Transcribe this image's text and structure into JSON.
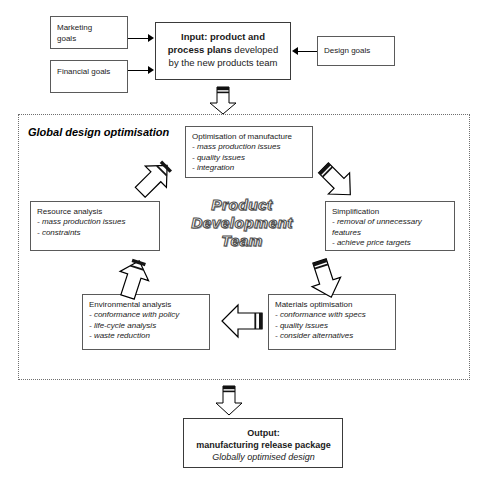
{
  "diagram": {
    "title": "Global design optimisation – product development team cycle",
    "top_cropped_text": "",
    "region_label": "Global design optimisation",
    "centre_wordmark": {
      "line1": "Product",
      "line2": "Development",
      "line3": "Team"
    }
  },
  "inputs": {
    "marketing": {
      "line1": "Marketing",
      "line2": "goals"
    },
    "financial": {
      "line1": "Financial goals",
      "line2": ""
    },
    "design": {
      "line1": "Design goals",
      "line2": ""
    }
  },
  "input_box": {
    "bold1": "Input: product and",
    "bold2": "process plans",
    "plain2": " developed",
    "plain3": "by the new products team"
  },
  "stages": [
    {
      "id": "optimisation-of-manufacture",
      "heading": "Optimisation of manufacture",
      "bullets": [
        "- mass production issues",
        "- quality issues",
        "- integration"
      ]
    },
    {
      "id": "simplification",
      "heading": "Simplification",
      "bullets": [
        "- removal of unnecessary features",
        "- achieve price targets"
      ]
    },
    {
      "id": "materials-optimisation",
      "heading": "Materials optimisation",
      "bullets": [
        "- conformance with specs",
        "- quality issues",
        "- consider alternatives"
      ]
    },
    {
      "id": "environmental-analysis",
      "heading": "Environmental analysis",
      "bullets": [
        "- conformance with policy",
        "- life-cycle analysis",
        "- waste reduction"
      ]
    },
    {
      "id": "resource-analysis",
      "heading": "Resource analysis",
      "bullets": [
        "- mass production issues",
        "- constraints"
      ]
    }
  ],
  "output_box": {
    "line1": "Output:",
    "line2": "manufacturing release package",
    "line3": "Globally optimised design"
  },
  "colors": {
    "box_border": "#5a5a5a",
    "region_border": "#6f6f6f",
    "arrow_outline": "#000000",
    "arrow_fill": "#ffffff",
    "arrow_tail_dark": "#1a1a1a",
    "text": "#1a1a1a",
    "background": "#ffffff"
  }
}
